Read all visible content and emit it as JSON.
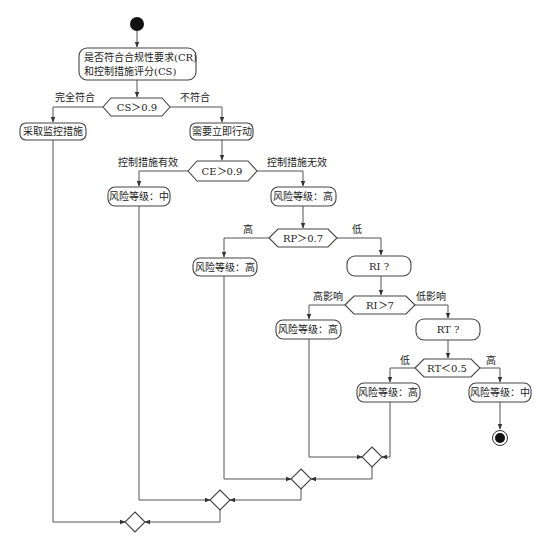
{
  "diagram": {
    "type": "uml-activity-flowchart",
    "start": {
      "label": ""
    },
    "end": {
      "label": ""
    },
    "nodes": {
      "assess": {
        "line1": "是否符合合规性要求(CR)",
        "line2": "和控制措施评分(CS)"
      },
      "cs_decision": {
        "label": "CS＞0.9"
      },
      "monitor": {
        "label": "采取监控措施"
      },
      "act_now": {
        "label": "需要立即行动"
      },
      "ce_decision": {
        "label": "CE＞0.9"
      },
      "risk_mid_1": {
        "label": "风险等级：中"
      },
      "risk_high_1": {
        "label": "风险等级：高"
      },
      "rp_decision": {
        "label": "RP＞0.7"
      },
      "risk_high_2": {
        "label": "风险等级：高"
      },
      "ri_query": {
        "label": "RI ?"
      },
      "ri_decision": {
        "label": "RI＞7"
      },
      "risk_high_3": {
        "label": "风险等级：高"
      },
      "rt_query": {
        "label": "RT ?"
      },
      "rt_decision": {
        "label": "RT＜0.5"
      },
      "risk_high_4": {
        "label": "风险等级：高"
      },
      "risk_mid_2": {
        "label": "风险等级：中"
      }
    },
    "edge_labels": {
      "cs_yes": "完全符合",
      "cs_no": "不符合",
      "ce_yes": "控制措施有效",
      "ce_no": "控制措施无效",
      "rp_high": "高",
      "rp_low": "低",
      "ri_high": "高影响",
      "ri_low": "低影响",
      "rt_low": "低",
      "rt_high": "高"
    },
    "merge_nodes": 4
  }
}
